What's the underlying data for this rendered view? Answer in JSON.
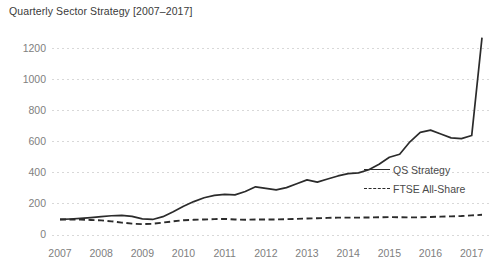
{
  "chart_data": {
    "type": "line",
    "title": "Quarterly Sector Strategy [2007–2017]",
    "xlabel": "",
    "ylabel": "",
    "xlim": [
      2007,
      2017.25
    ],
    "ylim": [
      0,
      1300
    ],
    "yticks": [
      0,
      200,
      400,
      600,
      800,
      1000,
      1200
    ],
    "ytick_labels": [
      "0",
      "200",
      "400",
      "600",
      "800",
      "1000",
      "1200"
    ],
    "xticks": [
      2007,
      2008,
      2009,
      2010,
      2011,
      2012,
      2013,
      2014,
      2015,
      2016,
      2017
    ],
    "xtick_labels": [
      "2007",
      "2008",
      "2009",
      "2010",
      "2011",
      "2012",
      "2013",
      "2014",
      "2015",
      "2016",
      "2017"
    ],
    "grid": "horizontal-dotted",
    "grid_color": "#d8d8d8",
    "legend_position": "center-right",
    "line_color": "#2b2b2b",
    "series": [
      {
        "name": "QS Strategy",
        "style": "solid",
        "x": [
          2007.0,
          2007.25,
          2007.5,
          2007.75,
          2008.0,
          2008.25,
          2008.5,
          2008.75,
          2009.0,
          2009.25,
          2009.5,
          2009.75,
          2010.0,
          2010.25,
          2010.5,
          2010.75,
          2011.0,
          2011.25,
          2011.5,
          2011.75,
          2012.0,
          2012.25,
          2012.5,
          2012.75,
          2013.0,
          2013.25,
          2013.5,
          2013.75,
          2014.0,
          2014.25,
          2014.5,
          2014.75,
          2015.0,
          2015.25,
          2015.5,
          2015.75,
          2016.0,
          2016.25,
          2016.5,
          2016.75,
          2017.0,
          2017.25
        ],
        "y": [
          100,
          103,
          107,
          112,
          118,
          124,
          126,
          120,
          104,
          100,
          118,
          150,
          185,
          215,
          240,
          255,
          262,
          258,
          280,
          310,
          300,
          290,
          305,
          330,
          355,
          340,
          360,
          380,
          395,
          400,
          420,
          455,
          500,
          520,
          600,
          660,
          675,
          650,
          625,
          620,
          640,
          1270
        ]
      },
      {
        "name": "FTSE All-Share",
        "style": "dashed",
        "x": [
          2007.0,
          2007.25,
          2007.5,
          2007.75,
          2008.0,
          2008.25,
          2008.5,
          2008.75,
          2009.0,
          2009.25,
          2009.5,
          2009.75,
          2010.0,
          2010.25,
          2010.5,
          2010.75,
          2011.0,
          2011.25,
          2011.5,
          2011.75,
          2012.0,
          2012.25,
          2012.5,
          2012.75,
          2013.0,
          2013.25,
          2013.5,
          2013.75,
          2014.0,
          2014.25,
          2014.5,
          2014.75,
          2015.0,
          2015.25,
          2015.5,
          2015.75,
          2016.0,
          2016.25,
          2016.5,
          2016.75,
          2017.0,
          2017.25
        ],
        "y": [
          100,
          100,
          99,
          97,
          94,
          88,
          80,
          73,
          70,
          72,
          80,
          88,
          95,
          98,
          100,
          102,
          104,
          100,
          98,
          100,
          100,
          100,
          102,
          104,
          106,
          108,
          110,
          112,
          112,
          112,
          113,
          114,
          115,
          114,
          113,
          114,
          116,
          118,
          120,
          122,
          126,
          130
        ]
      }
    ]
  },
  "legend": {
    "items": [
      {
        "label": "QS Strategy",
        "style": "solid"
      },
      {
        "label": "FTSE All-Share",
        "style": "dashed"
      }
    ]
  }
}
